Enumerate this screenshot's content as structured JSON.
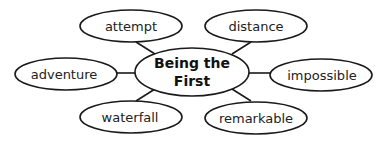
{
  "diagram": {
    "type": "mind-map",
    "center": {
      "line1": "Being the",
      "line2": "First"
    },
    "nodes": [
      {
        "label": "attempt"
      },
      {
        "label": "distance"
      },
      {
        "label": "adventure"
      },
      {
        "label": "impossible"
      },
      {
        "label": "waterfall"
      },
      {
        "label": "remarkable"
      }
    ],
    "colors": {
      "stroke": "#1a1a1a",
      "fill": "#ffffff"
    }
  }
}
